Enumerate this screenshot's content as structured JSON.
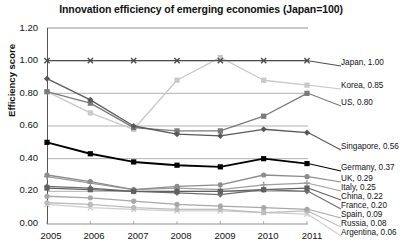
{
  "chart_data": {
    "type": "line",
    "title": "Innovation efficiency of emerging economies (Japan=100)",
    "xlabel": "",
    "ylabel": "Efficiency score",
    "categories": [
      "2005",
      "2006",
      "2007",
      "2008",
      "2009",
      "2010",
      "2011"
    ],
    "ylim": [
      0.0,
      1.2
    ],
    "yticks": [
      "0.00",
      "0.20",
      "0.40",
      "0.60",
      "0.80",
      "1.00",
      "1.20"
    ],
    "grid": "horizontal",
    "legend_position": "right-inline-labels",
    "series": [
      {
        "name": "Japan",
        "end_value": "1.00",
        "label": "Japan, 1.00",
        "color": "#4d4d4d",
        "marker": "x",
        "values": [
          1.0,
          1.0,
          1.0,
          1.0,
          1.0,
          1.0,
          1.0
        ]
      },
      {
        "name": "Korea",
        "end_value": "0.85",
        "label": "Korea, 0.85",
        "color": "#c9c9c9",
        "marker": "square",
        "values": [
          0.81,
          0.68,
          0.58,
          0.88,
          1.02,
          0.88,
          0.85
        ]
      },
      {
        "name": "US",
        "end_value": "0.80",
        "label": "US, 0.80",
        "color": "#7a7a7a",
        "marker": "square",
        "values": [
          0.81,
          0.74,
          0.59,
          0.57,
          0.57,
          0.66,
          0.8
        ]
      },
      {
        "name": "Singapore",
        "end_value": "0.56",
        "label": "Singapore, 0.56",
        "color": "#595959",
        "marker": "diamond",
        "values": [
          0.89,
          0.76,
          0.6,
          0.55,
          0.54,
          0.58,
          0.56
        ]
      },
      {
        "name": "Germany",
        "end_value": "0.37",
        "label": "Germany, 0.37",
        "color": "#000000",
        "marker": "square",
        "values": [
          0.5,
          0.43,
          0.38,
          0.36,
          0.35,
          0.4,
          0.37
        ]
      },
      {
        "name": "UK",
        "end_value": "0.29",
        "label": "UK, 0.29",
        "color": "#8c8c8c",
        "marker": "circle",
        "values": [
          0.3,
          0.26,
          0.21,
          0.23,
          0.24,
          0.3,
          0.29
        ]
      },
      {
        "name": "Italy",
        "end_value": "0.25",
        "label": "Italy, 0.25",
        "color": "#9e9e9e",
        "marker": "plus",
        "values": [
          0.29,
          0.25,
          0.21,
          0.22,
          0.21,
          0.24,
          0.25
        ]
      },
      {
        "name": "China",
        "end_value": "0.22",
        "label": "China, 0.22",
        "color": "#606060",
        "marker": "square",
        "values": [
          0.22,
          0.21,
          0.2,
          0.2,
          0.2,
          0.21,
          0.22
        ]
      },
      {
        "name": "France",
        "end_value": "0.20",
        "label": "France, 0.20",
        "color": "#6e6e6e",
        "marker": "diamond",
        "values": [
          0.23,
          0.22,
          0.2,
          0.19,
          0.18,
          0.21,
          0.2
        ]
      },
      {
        "name": "Spain",
        "end_value": "0.09",
        "label": "Spain, 0.09",
        "color": "#a8a8a8",
        "marker": "circle",
        "values": [
          0.17,
          0.16,
          0.14,
          0.12,
          0.11,
          0.1,
          0.09
        ]
      },
      {
        "name": "Russia",
        "end_value": "0.08",
        "label": "Russia, 0.08",
        "color": "#bcbcbc",
        "marker": "circle",
        "values": [
          0.13,
          0.12,
          0.1,
          0.09,
          0.09,
          0.07,
          0.08
        ]
      },
      {
        "name": "Argentina",
        "end_value": "0.06",
        "label": "Argentina, 0.06",
        "color": "#cfcfcf",
        "marker": "x",
        "values": [
          0.12,
          0.1,
          0.09,
          0.08,
          0.08,
          0.07,
          0.06
        ]
      }
    ]
  }
}
